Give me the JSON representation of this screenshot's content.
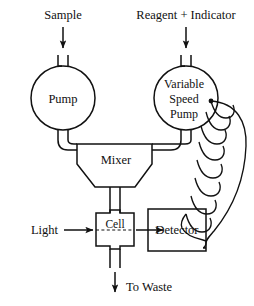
{
  "diagram": {
    "type": "process-flow-diagram",
    "background_color": "#ffffff",
    "line_color": "#111111",
    "labels": {
      "sample": "Sample",
      "reagent": "Reagent + Indicator",
      "pump": "Pump",
      "variable_speed_pump_line1": "Variable",
      "variable_speed_pump_line2": "Speed",
      "variable_speed_pump_line3": "Pump",
      "mixer": "Mixer",
      "light": "Light",
      "cell": "Cell",
      "detector": "Detector",
      "to_waste": "To Waste"
    },
    "components": [
      {
        "name": "pump",
        "shape": "circle",
        "label": "Pump"
      },
      {
        "name": "variable-speed-pump",
        "shape": "circle",
        "label": "Variable Speed Pump"
      },
      {
        "name": "mixer",
        "shape": "funnel",
        "label": "Mixer"
      },
      {
        "name": "mixing-coil",
        "shape": "helix",
        "label": ""
      },
      {
        "name": "cell",
        "shape": "flow-cell",
        "label": "Cell"
      },
      {
        "name": "detector",
        "shape": "rectangle",
        "label": "Detector"
      }
    ],
    "flows": [
      {
        "from": "Sample",
        "to": "Pump"
      },
      {
        "from": "Reagent + Indicator",
        "to": "Variable Speed Pump"
      },
      {
        "from": "Pump",
        "to": "Mixer"
      },
      {
        "from": "Variable Speed Pump",
        "to": "Mixer"
      },
      {
        "from": "Variable Speed Pump",
        "to": "Mixing Coil"
      },
      {
        "from": "Mixer",
        "to": "Cell"
      },
      {
        "from": "Light",
        "to": "Cell"
      },
      {
        "from": "Cell",
        "to": "Detector"
      },
      {
        "from": "Mixing Coil",
        "to": "Detector"
      },
      {
        "from": "Cell",
        "to": "To Waste"
      }
    ]
  }
}
